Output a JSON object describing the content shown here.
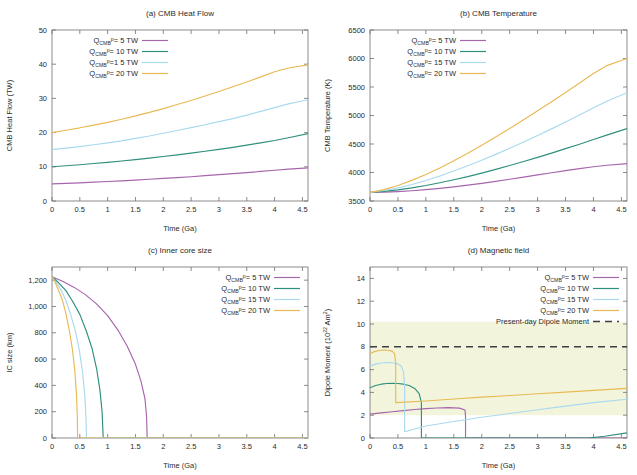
{
  "figure": {
    "axis_color": "#6f6f6f",
    "text_color": "#2b2b2b",
    "series_colors": [
      "#a765ad",
      "#2f8f7d",
      "#a9d9ef",
      "#e9ba54"
    ],
    "dashed_color": "#3f3f3f",
    "band_color": "#f2f5dc"
  },
  "legend_common": {
    "prefix": "Q",
    "sub": "CMB",
    "sup": "p",
    "entries": [
      "= 5 TW",
      "= 10 TW",
      "=1 5 TW",
      "= 20 TW"
    ],
    "entries_b": [
      "= 5 TW",
      "= 10 TW",
      "= 15 TW",
      "= 20 TW"
    ],
    "dashed_label": "Present-day Dipole Moment"
  },
  "chart_data": [
    {
      "type": "line",
      "panel": "a",
      "title": "(a) CMB Heat Flow",
      "xlabel": "Time (Ga)",
      "ylabel": "CMB Heat Flow (TW)",
      "xlim": [
        0,
        4.6
      ],
      "ylim": [
        0,
        50
      ],
      "xticks": [
        0,
        0.5,
        1,
        1.5,
        2,
        2.5,
        3,
        3.5,
        4,
        4.5
      ],
      "xticklabels": [
        "0",
        "0.5",
        "1",
        "1.5",
        "2",
        "2.5",
        "3",
        "3.5",
        "4",
        "4.5"
      ],
      "yticks": [
        0,
        10,
        20,
        30,
        40,
        50
      ],
      "yticklabels": [
        "0",
        "10",
        "20",
        "30",
        "40",
        "50"
      ],
      "grid": false,
      "legend_position": "top-left",
      "x": [
        0,
        0.25,
        0.5,
        0.75,
        1,
        1.25,
        1.5,
        1.75,
        2,
        2.25,
        2.5,
        2.75,
        3,
        3.25,
        3.5,
        3.75,
        4,
        4.25,
        4.6
      ],
      "series": [
        {
          "name": "QCMBp = 5 TW",
          "values": [
            5.0,
            5.15,
            5.3,
            5.5,
            5.7,
            5.9,
            6.1,
            6.35,
            6.6,
            6.85,
            7.1,
            7.4,
            7.7,
            8.0,
            8.3,
            8.65,
            9.0,
            9.3,
            9.7
          ]
        },
        {
          "name": "QCMBp = 10 TW",
          "values": [
            10.0,
            10.3,
            10.6,
            10.95,
            11.3,
            11.7,
            12.1,
            12.55,
            13.0,
            13.5,
            14.0,
            14.55,
            15.1,
            15.7,
            16.35,
            17.0,
            17.7,
            18.5,
            19.7
          ]
        },
        {
          "name": "QCMBp = 15 TW",
          "values": [
            15.0,
            15.45,
            15.9,
            16.45,
            17.0,
            17.6,
            18.3,
            19.0,
            19.8,
            20.6,
            21.45,
            22.3,
            23.2,
            24.1,
            25.1,
            26.2,
            27.3,
            28.4,
            29.6
          ]
        },
        {
          "name": "QCMBp = 20 TW",
          "values": [
            20.0,
            20.7,
            21.4,
            22.2,
            23.0,
            23.9,
            24.9,
            25.9,
            27.0,
            28.2,
            29.4,
            30.7,
            32.0,
            33.4,
            34.8,
            36.3,
            37.8,
            38.9,
            39.8
          ]
        }
      ]
    },
    {
      "type": "line",
      "panel": "b",
      "title": "(b) CMB Temperature",
      "xlabel": "Time (Ga)",
      "ylabel": "CMB Temperature (K)",
      "xlim": [
        0,
        4.6
      ],
      "ylim": [
        3500,
        6500
      ],
      "xticks": [
        0,
        0.5,
        1,
        1.5,
        2,
        2.5,
        3,
        3.5,
        4,
        4.5
      ],
      "xticklabels": [
        "0",
        "0.5",
        "1",
        "1.5",
        "2",
        "2.5",
        "3",
        "3.5",
        "4",
        "4.5"
      ],
      "yticks": [
        3500,
        4000,
        4500,
        5000,
        5500,
        6000,
        6500
      ],
      "yticklabels": [
        "3500",
        "4000",
        "4500",
        "5000",
        "5500",
        "6000",
        "6500"
      ],
      "grid": false,
      "legend_position": "top-left",
      "x": [
        0,
        0.25,
        0.5,
        0.75,
        1,
        1.25,
        1.5,
        1.75,
        2,
        2.25,
        2.5,
        2.75,
        3,
        3.25,
        3.5,
        3.75,
        4,
        4.25,
        4.6
      ],
      "series": [
        {
          "name": "QCMBp = 5 TW",
          "values": [
            3650,
            3655,
            3665,
            3680,
            3700,
            3722,
            3748,
            3778,
            3810,
            3845,
            3882,
            3920,
            3958,
            3996,
            4034,
            4068,
            4100,
            4128,
            4155
          ]
        },
        {
          "name": "QCMBp = 10 TW",
          "values": [
            3650,
            3668,
            3695,
            3730,
            3772,
            3820,
            3872,
            3928,
            3990,
            4055,
            4122,
            4192,
            4265,
            4340,
            4418,
            4495,
            4580,
            4660,
            4770
          ]
        },
        {
          "name": "QCMBp = 15 TW",
          "values": [
            3650,
            3685,
            3730,
            3790,
            3860,
            3938,
            4025,
            4118,
            4215,
            4318,
            4425,
            4535,
            4648,
            4765,
            4885,
            5008,
            5135,
            5255,
            5400
          ]
        },
        {
          "name": "QCMBp = 20 TW",
          "values": [
            3650,
            3700,
            3772,
            3862,
            3965,
            4080,
            4205,
            4338,
            4478,
            4622,
            4772,
            4925,
            5082,
            5242,
            5405,
            5570,
            5738,
            5880,
            6000
          ]
        }
      ]
    },
    {
      "type": "line",
      "panel": "c",
      "title": "(c) Inner core size",
      "xlabel": "Time (Ga)",
      "ylabel": "IC size (km)",
      "xlim": [
        0,
        4.6
      ],
      "ylim": [
        0,
        1300
      ],
      "xticks": [
        0,
        0.5,
        1,
        1.5,
        2,
        2.5,
        3,
        3.5,
        4,
        4.5
      ],
      "xticklabels": [
        "0",
        "0.5",
        "1",
        "1.5",
        "2",
        "2.5",
        "3",
        "3.5",
        "4",
        "4.5"
      ],
      "yticks": [
        0,
        200,
        400,
        600,
        800,
        1000,
        1200
      ],
      "yticklabels": [
        "0",
        "200",
        "400",
        "600",
        "800",
        "1,000",
        "1,200"
      ],
      "grid": false,
      "legend_position": "top-right",
      "series": [
        {
          "name": "QCMBp = 5 TW",
          "x": [
            0,
            0.2,
            0.4,
            0.6,
            0.8,
            1.0,
            1.2,
            1.35,
            1.5,
            1.6,
            1.67,
            1.7,
            1.71,
            4.6
          ],
          "values": [
            1225,
            1190,
            1145,
            1090,
            1020,
            930,
            810,
            700,
            560,
            430,
            300,
            160,
            0,
            0
          ]
        },
        {
          "name": "QCMBp = 10 TW",
          "x": [
            0,
            0.12,
            0.25,
            0.37,
            0.5,
            0.62,
            0.72,
            0.8,
            0.86,
            0.9,
            0.92,
            4.6
          ],
          "values": [
            1225,
            1180,
            1120,
            1040,
            940,
            810,
            680,
            530,
            370,
            200,
            0,
            0
          ]
        },
        {
          "name": "QCMBp = 15 TW",
          "x": [
            0,
            0.08,
            0.17,
            0.25,
            0.33,
            0.42,
            0.49,
            0.55,
            0.59,
            0.61,
            0.62,
            4.6
          ],
          "values": [
            1225,
            1180,
            1120,
            1045,
            945,
            815,
            670,
            500,
            320,
            150,
            0,
            0
          ]
        },
        {
          "name": "QCMBp = 20 TW",
          "x": [
            0,
            0.06,
            0.12,
            0.19,
            0.25,
            0.31,
            0.37,
            0.41,
            0.44,
            0.455,
            0.46,
            4.6
          ],
          "values": [
            1225,
            1180,
            1120,
            1045,
            945,
            820,
            665,
            510,
            330,
            160,
            0,
            0
          ]
        }
      ]
    },
    {
      "type": "line",
      "panel": "d",
      "title": "(d) Magnetic field",
      "xlabel": "Time (Ga)",
      "ylabel": "Dipole Moment (10^22 Am^2)",
      "ylabel_main": "Dipole Moment (10",
      "ylabel_sup1": "22",
      "ylabel_mid": " Am",
      "ylabel_sup2": "2",
      "ylabel_end": ")",
      "xlim": [
        0,
        4.6
      ],
      "ylim": [
        0,
        15
      ],
      "xticks": [
        0,
        0.5,
        1,
        1.5,
        2,
        2.5,
        3,
        3.5,
        4,
        4.5
      ],
      "xticklabels": [
        "0",
        "0.5",
        "1",
        "1.5",
        "2",
        "2.5",
        "3",
        "3.5",
        "4",
        "4.5"
      ],
      "yticks": [
        0,
        2,
        4,
        6,
        8,
        10,
        12,
        14
      ],
      "yticklabels": [
        "0",
        "2",
        "4",
        "6",
        "8",
        "10",
        "12",
        "14"
      ],
      "grid": false,
      "legend_position": "top-right",
      "band": {
        "ymin": 2.0,
        "ymax": 10.2,
        "label": "paleointensity range"
      },
      "present_day_dipole": 8.0,
      "series": [
        {
          "name": "QCMBp = 5 TW",
          "x": [
            0,
            0.2,
            0.4,
            0.6,
            0.8,
            1.0,
            1.2,
            1.4,
            1.6,
            1.7,
            1.71,
            1.71,
            4.6
          ],
          "values": [
            2.1,
            2.2,
            2.3,
            2.4,
            2.5,
            2.58,
            2.63,
            2.66,
            2.62,
            2.45,
            1.9,
            0.0,
            0.0
          ]
        },
        {
          "name": "QCMBp = 10 TW",
          "x": [
            0,
            0.1,
            0.2,
            0.3,
            0.4,
            0.5,
            0.6,
            0.7,
            0.8,
            0.88,
            0.92,
            0.92,
            3.9,
            4.2,
            4.6
          ],
          "values": [
            4.4,
            4.6,
            4.72,
            4.78,
            4.8,
            4.78,
            4.72,
            4.6,
            4.35,
            3.9,
            3.1,
            0.0,
            0.0,
            0.15,
            0.45
          ]
        },
        {
          "name": "QCMBp = 15 TW",
          "x": [
            0,
            0.1,
            0.2,
            0.3,
            0.4,
            0.5,
            0.56,
            0.6,
            0.62,
            0.62,
            1.0,
            1.5,
            2.0,
            2.5,
            3.0,
            3.5,
            4.0,
            4.6
          ],
          "values": [
            6.3,
            6.48,
            6.58,
            6.62,
            6.6,
            6.5,
            6.3,
            5.8,
            4.6,
            0.55,
            1.05,
            1.45,
            1.82,
            2.15,
            2.48,
            2.8,
            3.1,
            3.4
          ]
        },
        {
          "name": "QCMBp = 20 TW",
          "x": [
            0,
            0.08,
            0.16,
            0.24,
            0.32,
            0.4,
            0.44,
            0.46,
            0.46,
            1.0,
            1.5,
            2.0,
            2.5,
            3.0,
            3.5,
            4.0,
            4.6
          ],
          "values": [
            7.4,
            7.58,
            7.68,
            7.72,
            7.7,
            7.6,
            7.4,
            6.6,
            3.1,
            3.25,
            3.42,
            3.58,
            3.73,
            3.88,
            4.03,
            4.18,
            4.35
          ]
        }
      ]
    }
  ]
}
